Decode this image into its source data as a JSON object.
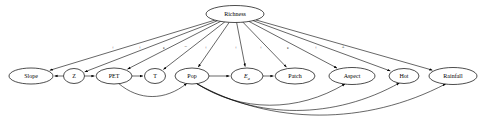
{
  "diagram": {
    "type": "directed-acyclic-graph",
    "background_color": "#ffffff",
    "stroke_color": "#000000",
    "root": {
      "id": "richness",
      "label": "Richness",
      "cx": 235,
      "cy": 14,
      "rx": 29,
      "ry": 8.5
    },
    "nodes": [
      {
        "id": "slope",
        "label": "Slope",
        "cx": 31,
        "cy": 76,
        "rx": 22,
        "ry": 8,
        "italic": false
      },
      {
        "id": "z",
        "label": "Z",
        "cx": 74,
        "cy": 76,
        "rx": 10.5,
        "ry": 7.5,
        "italic": false
      },
      {
        "id": "pet",
        "label": "PET",
        "cx": 114,
        "cy": 76,
        "rx": 18,
        "ry": 8,
        "italic": false
      },
      {
        "id": "t",
        "label": "T",
        "cx": 155,
        "cy": 76,
        "rx": 10.5,
        "ry": 7.5,
        "italic": false
      },
      {
        "id": "pop",
        "label": "Pop",
        "cx": 192,
        "cy": 76,
        "rx": 17,
        "ry": 8,
        "italic": false
      },
      {
        "id": "ea",
        "label": "E",
        "sub": "a",
        "cx": 247,
        "cy": 76,
        "rx": 16,
        "ry": 8,
        "italic": true
      },
      {
        "id": "patch",
        "label": "Patch",
        "cx": 295,
        "cy": 76,
        "rx": 20,
        "ry": 8,
        "italic": false
      },
      {
        "id": "aspect",
        "label": "Aspect",
        "cx": 352,
        "cy": 76,
        "rx": 23,
        "ry": 8.5,
        "italic": false
      },
      {
        "id": "hot",
        "label": "Hot",
        "cx": 404,
        "cy": 76,
        "rx": 15,
        "ry": 7.5,
        "italic": false
      },
      {
        "id": "rainfall",
        "label": "Rainfall",
        "cx": 453,
        "cy": 76,
        "rx": 24,
        "ry": 8.5,
        "italic": false
      }
    ],
    "root_edges": [
      {
        "from": "richness",
        "to": "slope",
        "sign": "+",
        "label_x": 113,
        "label_y": 47
      },
      {
        "from": "richness",
        "to": "z",
        "sign": "+",
        "label_x": 140,
        "label_y": 47
      },
      {
        "from": "richness",
        "to": "pet",
        "sign": "e",
        "label_x": 164,
        "label_y": 47
      },
      {
        "from": "richness",
        "to": "t",
        "sign": "−",
        "label_x": 186,
        "label_y": 46
      },
      {
        "from": "richness",
        "to": "pop",
        "sign": "+",
        "label_x": 206,
        "label_y": 47
      },
      {
        "from": "richness",
        "to": "ea",
        "sign": "+",
        "label_x": 236,
        "label_y": 47
      },
      {
        "from": "richness",
        "to": "patch",
        "sign": "+",
        "label_x": 261,
        "label_y": 47
      },
      {
        "from": "richness",
        "to": "aspect",
        "sign": "e",
        "label_x": 288,
        "label_y": 47
      },
      {
        "from": "richness",
        "to": "hot",
        "sign": "+",
        "label_x": 316,
        "label_y": 47
      },
      {
        "from": "richness",
        "to": "rainfall",
        "sign": "±",
        "label_x": 343,
        "label_y": 46
      }
    ],
    "chain_edges": [
      {
        "from": "z",
        "to": "slope"
      },
      {
        "from": "z",
        "to": "pet"
      },
      {
        "from": "pet",
        "to": "t"
      },
      {
        "from": "pop",
        "to": "ea"
      },
      {
        "from": "ea",
        "to": "patch"
      }
    ],
    "curved_edges": [
      {
        "from": "pet",
        "to": "pop",
        "direction": "below"
      },
      {
        "from": "pop",
        "to": "aspect",
        "direction": "below"
      },
      {
        "from": "pop",
        "to": "hot",
        "direction": "below"
      },
      {
        "from": "pop",
        "to": "rainfall",
        "direction": "below"
      }
    ]
  }
}
